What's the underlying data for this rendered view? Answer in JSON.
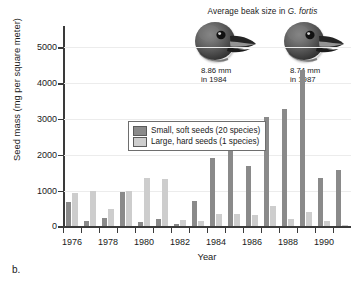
{
  "panel_letter": "b.",
  "annotation": {
    "title_prefix": "Average beak size in ",
    "species": "G. fortis",
    "beaks": [
      {
        "name": "beak-1984",
        "size": "8.86 mm",
        "year_line": "in 1984"
      },
      {
        "name": "beak-1987",
        "size": "8.74 mm",
        "year_line": "in 1987"
      }
    ]
  },
  "legend": {
    "items": [
      {
        "label": "Small, soft seeds (20 species)",
        "color": "#8a8a8a",
        "key": "small"
      },
      {
        "label": "Large, hard seeds (1 species)",
        "color": "#cdcdcd",
        "key": "large"
      }
    ]
  },
  "chart_data": {
    "type": "bar",
    "title": "",
    "xlabel": "Year",
    "ylabel": "Seed mass (mg per square meter)",
    "ylim": [
      0,
      5600
    ],
    "yticks": [
      0,
      1000,
      2000,
      3000,
      4000,
      5000
    ],
    "ytick_labels": [
      "0",
      "1000",
      "2000",
      "3000",
      "4000",
      "5000"
    ],
    "xlim": [
      1975.5,
      1991.5
    ],
    "categories": [
      1976,
      1977,
      1978,
      1979,
      1980,
      1981,
      1982,
      1983,
      1984,
      1985,
      1986,
      1987,
      1988,
      1989,
      1990,
      1991
    ],
    "xtick_labels": [
      "1976",
      "1978",
      "1980",
      "1982",
      "1984",
      "1986",
      "1988",
      "1990"
    ],
    "xticks": [
      1976,
      1978,
      1980,
      1982,
      1984,
      1986,
      1988,
      1990
    ],
    "grid": true,
    "legend_position": "upper-left-inside",
    "series": [
      {
        "name": "Small, soft seeds (20 species)",
        "color": "#8a8a8a",
        "values": [
          670,
          150,
          230,
          950,
          120,
          220,
          80,
          700,
          1920,
          2160,
          1680,
          3050,
          3270,
          4380,
          1340,
          1580
        ]
      },
      {
        "name": "Large, hard seeds (1 species)",
        "color": "#cdcdcd",
        "values": [
          930,
          990,
          500,
          990,
          1340,
          1330,
          170,
          140,
          360,
          350,
          310,
          560,
          220,
          400,
          150,
          40
        ]
      }
    ]
  }
}
